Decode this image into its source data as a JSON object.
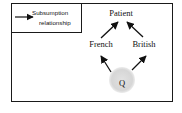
{
  "legend": {
    "line1": "Subsumption",
    "line2": "relationship",
    "arrow_icon": "arrow-right"
  },
  "nodes": {
    "root": "Patient",
    "left": "French",
    "right": "British",
    "query": "Q"
  },
  "edges": [
    {
      "from": "French",
      "to": "Patient"
    },
    {
      "from": "British",
      "to": "Patient"
    },
    {
      "from": "Q",
      "to": "French"
    },
    {
      "from": "Q",
      "to": "British"
    }
  ],
  "colors": {
    "stroke": "#1a1a1a",
    "query_shade": "#d9d9d9",
    "background": "#ffffff"
  }
}
